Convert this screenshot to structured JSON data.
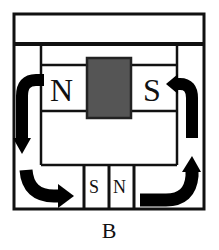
{
  "diagram": {
    "caption": "B",
    "top_magnet": {
      "left_pole": "N",
      "right_pole": "S",
      "core_color": "#555555"
    },
    "bottom_magnet": {
      "left_pole": "S",
      "right_pole": "N"
    },
    "arrows": [
      {
        "name": "left-down-arrow",
        "direction": "down"
      },
      {
        "name": "bottom-left-curve-arrow",
        "direction": "right"
      },
      {
        "name": "bottom-right-curve-arrow",
        "direction": "up"
      },
      {
        "name": "right-up-arrow",
        "direction": "left"
      }
    ],
    "colors": {
      "line": "#111111",
      "arrow": "#000000",
      "background": "#ffffff"
    }
  }
}
